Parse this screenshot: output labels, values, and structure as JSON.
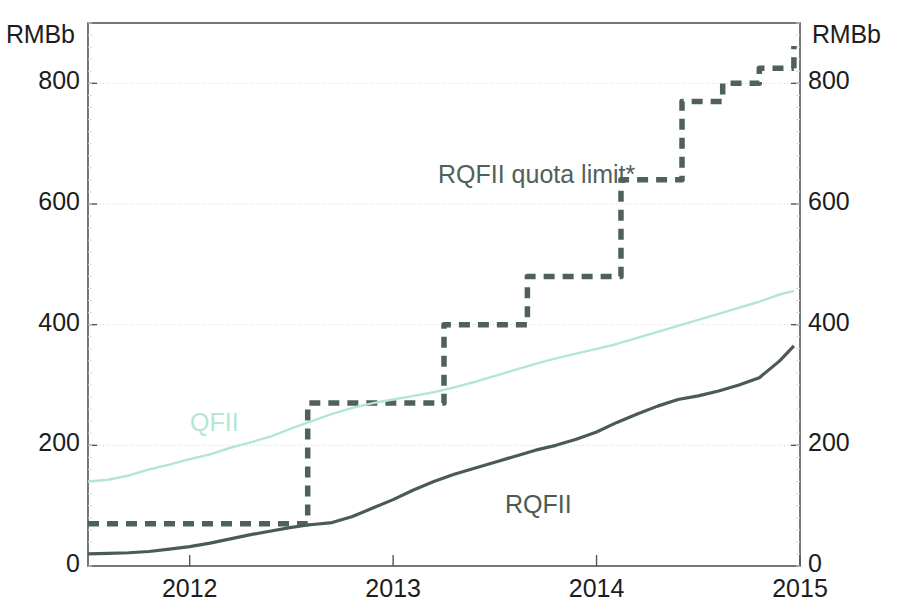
{
  "axes": {
    "unit_left": "RMBb",
    "unit_right": "RMBb",
    "y_ticks": [
      "0",
      "200",
      "400",
      "600",
      "800"
    ],
    "y_tick_values": [
      0,
      200,
      400,
      600,
      800
    ],
    "x_ticks": [
      "2012",
      "2013",
      "2014",
      "2015"
    ],
    "ylim": [
      0,
      900
    ],
    "xlim": [
      2011.5,
      2015.0
    ]
  },
  "labels": {
    "qfii": "QFII",
    "rqfii": "RQFII",
    "quota_limit": "RQFII quota limit*"
  },
  "colors": {
    "qfii": "#b4e6d2",
    "rqfii": "#4a5c52",
    "quota_limit": "#4f6159",
    "axis": "#555555",
    "grid": "#d8d8d8",
    "text": "#1d1d1d",
    "background": "#ffffff"
  },
  "chart_data": {
    "type": "line",
    "title": "",
    "xlabel": "",
    "ylabel": "RMBb",
    "ylim": [
      0,
      900
    ],
    "xlim": [
      2011.5,
      2015.0
    ],
    "grid": true,
    "legend": "inline-annotations",
    "x_tick_labels": [
      "2012",
      "2013",
      "2014",
      "2015"
    ],
    "x_tick_values": [
      2012,
      2013,
      2014,
      2015
    ],
    "y_tick_labels": [
      "0",
      "200",
      "400",
      "600",
      "800"
    ],
    "y_tick_values": [
      0,
      200,
      400,
      600,
      800
    ],
    "series": [
      {
        "name": "RQFII quota limit*",
        "style": "dashed-step",
        "color": "#4f6159",
        "x": [
          2011.5,
          2012.58,
          2012.58,
          2013.25,
          2013.25,
          2013.66,
          2013.66,
          2014.12,
          2014.12,
          2014.42,
          2014.42,
          2014.62,
          2014.62,
          2014.8,
          2014.8,
          2014.97
        ],
        "y": [
          70,
          70,
          270,
          270,
          400,
          400,
          480,
          480,
          640,
          640,
          770,
          770,
          800,
          800,
          825,
          825
        ],
        "steps": [
          {
            "from_x": 2011.5,
            "to_x": 2012.58,
            "value": 70
          },
          {
            "from_x": 2012.58,
            "to_x": 2013.25,
            "value": 270
          },
          {
            "from_x": 2013.25,
            "to_x": 2013.66,
            "value": 400
          },
          {
            "from_x": 2013.66,
            "to_x": 2014.12,
            "value": 480
          },
          {
            "from_x": 2014.12,
            "to_x": 2014.42,
            "value": 640
          },
          {
            "from_x": 2014.42,
            "to_x": 2014.62,
            "value": 770
          },
          {
            "from_x": 2014.62,
            "to_x": 2014.8,
            "value": 800
          },
          {
            "from_x": 2014.8,
            "to_x": 2014.97,
            "value": 825
          },
          {
            "from_x": 2014.97,
            "to_x": 2014.97,
            "value": 862
          }
        ]
      },
      {
        "name": "QFII",
        "style": "solid",
        "color": "#b4e6d2",
        "x": [
          2011.5,
          2011.6,
          2011.7,
          2011.8,
          2011.9,
          2012.0,
          2012.1,
          2012.2,
          2012.3,
          2012.4,
          2012.5,
          2012.6,
          2012.7,
          2012.8,
          2012.9,
          2013.0,
          2013.1,
          2013.2,
          2013.3,
          2013.4,
          2013.5,
          2013.6,
          2013.7,
          2013.8,
          2013.9,
          2014.0,
          2014.1,
          2014.2,
          2014.3,
          2014.4,
          2014.5,
          2014.6,
          2014.7,
          2014.8,
          2014.9,
          2014.97
        ],
        "y": [
          140,
          143,
          150,
          160,
          168,
          177,
          185,
          196,
          205,
          215,
          228,
          240,
          252,
          262,
          270,
          276,
          282,
          288,
          296,
          305,
          315,
          325,
          335,
          344,
          352,
          360,
          368,
          378,
          388,
          398,
          408,
          418,
          428,
          438,
          450,
          456
        ]
      },
      {
        "name": "RQFII",
        "style": "solid",
        "color": "#4a5c52",
        "x": [
          2011.5,
          2011.6,
          2011.7,
          2011.8,
          2011.9,
          2012.0,
          2012.1,
          2012.2,
          2012.3,
          2012.4,
          2012.5,
          2012.58,
          2012.7,
          2012.8,
          2012.9,
          2013.0,
          2013.1,
          2013.2,
          2013.3,
          2013.4,
          2013.5,
          2013.6,
          2013.7,
          2013.8,
          2013.9,
          2014.0,
          2014.1,
          2014.2,
          2014.3,
          2014.4,
          2014.5,
          2014.6,
          2014.7,
          2014.8,
          2014.9,
          2014.97
        ],
        "y": [
          20,
          21,
          22,
          24,
          28,
          32,
          38,
          45,
          52,
          58,
          64,
          68,
          72,
          82,
          96,
          110,
          126,
          140,
          152,
          162,
          172,
          182,
          192,
          200,
          210,
          222,
          238,
          252,
          265,
          276,
          282,
          290,
          300,
          312,
          340,
          365
        ]
      }
    ]
  }
}
